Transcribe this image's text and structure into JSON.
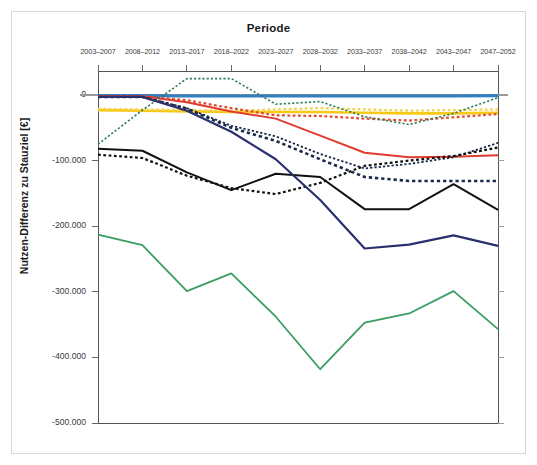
{
  "chart_data": {
    "type": "line",
    "title": "Periode",
    "xlabel": "Periode",
    "ylabel": "Nutzen-Differenz zu Stauziel [€]",
    "categories": [
      "2003–2007",
      "2008–2012",
      "2013–2017",
      "2018–2022",
      "2023–2027",
      "2028–2032",
      "2033–2037",
      "2038–2042",
      "2043–2047",
      "2047–2052"
    ],
    "ytick_labels": [
      "0",
      "-100.000",
      "-200.000",
      "-300.000",
      "-400.000",
      "-500.000"
    ],
    "ytick_values": [
      0,
      -100000,
      -200000,
      -300000,
      -400000,
      -500000
    ],
    "ylim": [
      -500000,
      30000
    ],
    "grid": false,
    "legend": "none",
    "axis_position": "x-axis-top",
    "series": [
      {
        "name": "blue-solid-flat",
        "color": "#2f7fc1",
        "style": "solid",
        "width": 3.2,
        "values": [
          -1000,
          -1000,
          -1500,
          -1500,
          -1500,
          -1500,
          -1500,
          -1500,
          -1500,
          -1000
        ]
      },
      {
        "name": "yellow-solid",
        "color": "#f7c815",
        "style": "solid",
        "width": 2.6,
        "values": [
          -23000,
          -24000,
          -25000,
          -26000,
          -26000,
          -26000,
          -27000,
          -28000,
          -28000,
          -27000
        ]
      },
      {
        "name": "yellow-dashed",
        "color": "#f3d24a",
        "style": "dashed",
        "width": 2.2,
        "values": [
          -21000,
          -22000,
          -23000,
          -24000,
          -22000,
          -20000,
          -22000,
          -24000,
          -23000,
          -22000
        ]
      },
      {
        "name": "orange-red-dashed",
        "color": "#e04a2f",
        "style": "dashed",
        "width": 2.2,
        "values": [
          -2000,
          -2000,
          -8000,
          -20000,
          -31000,
          -32000,
          -36000,
          -39000,
          -34000,
          -29000
        ]
      },
      {
        "name": "red-solid",
        "color": "#e03b2e",
        "style": "solid",
        "width": 2.0,
        "values": [
          -2000,
          -2000,
          -11000,
          -25000,
          -36000,
          -62000,
          -88000,
          -95000,
          -94000,
          -92000
        ]
      },
      {
        "name": "green-dashed",
        "color": "#2e7d5b",
        "style": "dashed",
        "width": 1.6,
        "values": [
          -75000,
          -23000,
          25000,
          25000,
          -14000,
          -10000,
          -33000,
          -45000,
          -28000,
          -4000
        ]
      },
      {
        "name": "navy-dashed-upper",
        "color": "#1b2a4a",
        "style": "dashed",
        "width": 1.8,
        "values": [
          -3000,
          -3000,
          -20000,
          -47000,
          -63000,
          -90000,
          -112000,
          -105000,
          -95000,
          -73000
        ]
      },
      {
        "name": "navy-dashed-lower",
        "color": "#1b2a4a",
        "style": "dashed",
        "width": 2.6,
        "values": [
          -3000,
          -3000,
          -21000,
          -50000,
          -70000,
          -98000,
          -125000,
          -131000,
          -131000,
          -131000
        ]
      },
      {
        "name": "black-solid",
        "color": "#111111",
        "style": "solid",
        "width": 2.0,
        "values": [
          -82000,
          -85000,
          -118000,
          -145000,
          -120000,
          -125000,
          -174000,
          -174000,
          -136000,
          -175000
        ]
      },
      {
        "name": "black-dashed",
        "color": "#111111",
        "style": "dashed",
        "width": 2.2,
        "values": [
          -91000,
          -96000,
          -123000,
          -142000,
          -151000,
          -134000,
          -108000,
          -100000,
          -93000,
          -80000
        ]
      },
      {
        "name": "darkblue-solid",
        "color": "#2a2f6e",
        "style": "solid",
        "width": 2.2,
        "values": [
          -3000,
          -3000,
          -24000,
          -56000,
          -98000,
          -160000,
          -234000,
          -228000,
          -214000,
          -230000
        ]
      },
      {
        "name": "green-solid",
        "color": "#3a9d63",
        "style": "solid",
        "width": 1.8,
        "values": [
          -213000,
          -229000,
          -299000,
          -272000,
          -338000,
          -418000,
          -347000,
          -333000,
          -299000,
          -357000
        ]
      }
    ]
  },
  "plot": {
    "left": 98,
    "right": 498,
    "top": 71,
    "bottom": 423,
    "y_zero_px": 95,
    "px_per_100k": 65.6
  }
}
